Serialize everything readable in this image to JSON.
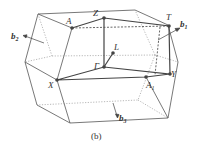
{
  "figure": {
    "caption": "(b)",
    "points": [
      {
        "name": "A",
        "label": "A",
        "x": 72,
        "y": 28
      },
      {
        "name": "Z",
        "label": "Z",
        "x": 104,
        "y": 18
      },
      {
        "name": "T",
        "label": "T",
        "x": 169,
        "y": 26
      },
      {
        "name": "L",
        "label": "L",
        "x": 113,
        "y": 53
      },
      {
        "name": "Gamma",
        "label": "Γ",
        "x": 104,
        "y": 67
      },
      {
        "name": "Y",
        "label": "Y",
        "x": 170,
        "y": 74
      },
      {
        "name": "X",
        "label": "X",
        "x": 57,
        "y": 80
      },
      {
        "name": "A1",
        "label": "A",
        "sub": "1",
        "x": 146,
        "y": 77
      }
    ],
    "vectors": [
      {
        "name": "b1",
        "label": "b",
        "sub": "1"
      },
      {
        "name": "b2",
        "label": "b",
        "sub": "2"
      },
      {
        "name": "b3",
        "label": "b",
        "sub": "3"
      }
    ],
    "colors": {
      "line": "#555555",
      "path": "#444444",
      "dashed": "#777777",
      "point": "#444444"
    }
  }
}
